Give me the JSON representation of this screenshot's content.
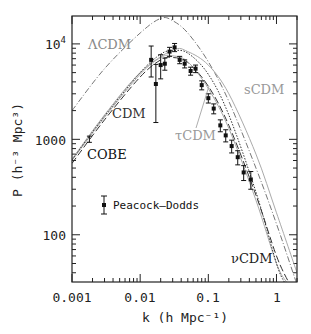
{
  "chart_data": {
    "type": "line",
    "title": "",
    "xlabel": "k (h Mpc⁻¹)",
    "ylabel": "P (h⁻³ Mpc³)",
    "xscale": "log",
    "yscale": "log",
    "xlim": [
      0.001,
      2
    ],
    "ylim": [
      32,
      19600
    ],
    "x_ticks": [
      "0.001",
      "0.01",
      "0.1",
      "1"
    ],
    "y_ticks": [
      "100",
      "1000",
      "10⁴"
    ],
    "grid": false,
    "series": [
      {
        "name": "ΛCDM",
        "style": "dash-dot",
        "color": "#777777",
        "x": [
          0.001,
          0.003,
          0.01,
          0.02,
          0.03,
          0.05,
          0.1,
          0.2,
          0.5,
          1,
          2
        ],
        "values": [
          2000,
          5500,
          13000,
          18500,
          17500,
          13000,
          6500,
          2500,
          500,
          130,
          30
        ]
      },
      {
        "name": "sCDM",
        "style": "solid",
        "color": "#aaaaaa",
        "x": [
          0.001,
          0.003,
          0.01,
          0.03,
          0.05,
          0.1,
          0.2,
          0.5,
          1,
          2
        ],
        "values": [
          620,
          1800,
          5000,
          8600,
          8300,
          6000,
          3000,
          700,
          170,
          40
        ]
      },
      {
        "name": "CDM",
        "style": "dashed",
        "color": "#333333",
        "x": [
          0.001,
          0.003,
          0.01,
          0.02,
          0.03,
          0.05,
          0.1,
          0.2,
          0.5,
          1,
          1.5
        ],
        "values": [
          560,
          1600,
          4500,
          6800,
          7200,
          6400,
          3600,
          1400,
          260,
          60,
          32
        ]
      },
      {
        "name": "τCDM",
        "style": "solid",
        "color": "#aaaaaa",
        "x": [
          0.001,
          0.003,
          0.01,
          0.02,
          0.03,
          0.05,
          0.1,
          0.2,
          0.5,
          1,
          1.4
        ],
        "values": [
          600,
          1700,
          4800,
          7200,
          7500,
          6500,
          3400,
          1300,
          230,
          50,
          32
        ]
      },
      {
        "name": "νCDM",
        "style": "dotted",
        "color": "#333333",
        "x": [
          0.001,
          0.003,
          0.01,
          0.02,
          0.03,
          0.05,
          0.1,
          0.2,
          0.5,
          1,
          1.3
        ],
        "values": [
          610,
          1750,
          5000,
          7800,
          8500,
          8000,
          4800,
          1800,
          280,
          50,
          32
        ]
      },
      {
        "name": "Peacock–Dodds",
        "style": "points_errorbars",
        "color": "#111111",
        "x": [
          0.0145,
          0.017,
          0.02,
          0.023,
          0.027,
          0.032,
          0.038,
          0.045,
          0.055,
          0.065,
          0.08,
          0.1,
          0.12,
          0.15,
          0.18,
          0.22,
          0.27,
          0.33,
          0.42
        ],
        "values": [
          6800,
          3800,
          6000,
          6200,
          8300,
          9200,
          6800,
          6200,
          5200,
          5500,
          3700,
          2700,
          2100,
          1400,
          1100,
          850,
          650,
          450,
          380
        ],
        "err_low": [
          4500,
          1500,
          4300,
          5300,
          7400,
          8300,
          6200,
          5600,
          4700,
          5000,
          3300,
          2400,
          1850,
          1200,
          940,
          720,
          540,
          370,
          300
        ],
        "err_high": [
          9500,
          6100,
          7700,
          7100,
          9200,
          10100,
          7400,
          6800,
          5700,
          6000,
          4100,
          3000,
          2350,
          1600,
          1260,
          980,
          760,
          530,
          460
        ]
      },
      {
        "name": "COBE",
        "style": "errorbar",
        "color": "#111111",
        "x": [
          0.0018
        ],
        "values": [
          1000
        ],
        "err_low": [
          930
        ],
        "err_high": [
          1080
        ]
      }
    ],
    "annotations": [
      {
        "text": "ΛCDM",
        "x": 0.0022,
        "y": 10000
      },
      {
        "text": "CDM",
        "x": 0.006,
        "y": 1900
      },
      {
        "text": "COBE",
        "x": 0.0018,
        "y": 780
      },
      {
        "text": "sCDM",
        "x": 0.28,
        "y": 5200
      },
      {
        "text": "τCDM",
        "x": 0.075,
        "y": 1400
      },
      {
        "text": "νCDM",
        "x": 0.6,
        "y": 60
      },
      {
        "text": "Peacock–Dodds",
        "x": 0.0045,
        "y": 200
      }
    ],
    "legend": {
      "entries": [
        "Peacock–Dodds"
      ],
      "position": "lower-left (inside)"
    }
  },
  "labels": {
    "xlabel": "k (h Mpc⁻¹)",
    "ylabel": "P (h⁻³ Mpc³)",
    "xticks": [
      "0.001",
      "0.01",
      "0.1",
      "1"
    ],
    "y100": "100",
    "y1000": "1000",
    "y10k_base": "10",
    "y10k_exp": "4",
    "lcdm": "ΛCDM",
    "cdm": "CDM",
    "cobe": "COBE",
    "scdm": "sCDM",
    "tcdm": "τCDM",
    "ncdm": "νCDM",
    "legend_pd": "Peacock–Dodds"
  }
}
